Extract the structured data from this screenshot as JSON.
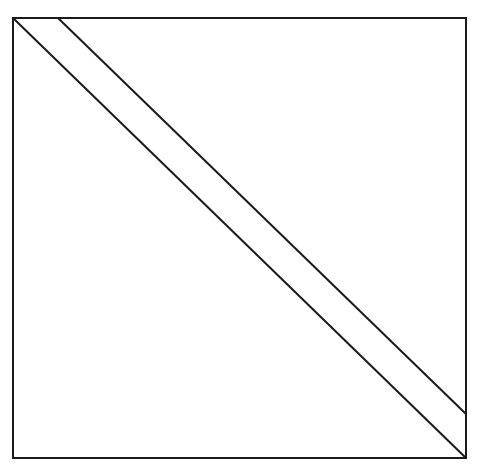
{
  "diagram": {
    "type": "geometric-figure",
    "stroke_color": "#1a1a1a",
    "background": "#ffffff",
    "square": {
      "x1": 13,
      "y1": 18,
      "x2": 466,
      "y2": 458
    },
    "lines": [
      {
        "name": "main-diagonal",
        "x1": 13,
        "y1": 18,
        "x2": 466,
        "y2": 458
      },
      {
        "name": "offset-diagonal",
        "x1": 58,
        "y1": 18,
        "x2": 466,
        "y2": 414
      }
    ]
  }
}
